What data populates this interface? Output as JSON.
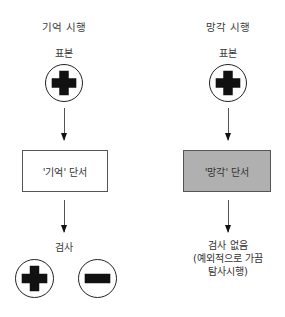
{
  "left_column": {
    "title": "기억 시행",
    "sample_label": "표본",
    "sample_symbol": "plus",
    "cue_box_label": "'기억' 단서",
    "cue_box_fill": "#ffffff",
    "test_label": "검사",
    "test_symbols": [
      "plus",
      "minus"
    ]
  },
  "right_column": {
    "title": "망각 시행",
    "sample_label": "표본",
    "sample_symbol": "plus",
    "cue_box_label": "'망각' 단서",
    "cue_box_fill": "#b0b0b0",
    "outcome_lines": [
      "검사 없음",
      "(예외적으로 가끔",
      "탐사시행)"
    ]
  },
  "colors": {
    "stroke": "#222222",
    "symbol_fill": "#111111",
    "forget_box_fill": "#b0b0b0"
  }
}
